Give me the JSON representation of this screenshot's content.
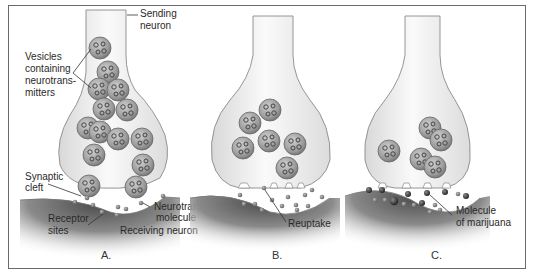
{
  "labels": {
    "sending_neuron": [
      "Sending",
      "neuron"
    ],
    "vesicles": [
      "Vesicles",
      "containing",
      "neurotrans-",
      "mitters"
    ],
    "synaptic_cleft": [
      "Synaptic",
      "cleft"
    ],
    "receptor_sites": [
      "Receptor",
      "sites"
    ],
    "neurotransmitter_molecule": [
      "Neurotransmitter",
      "molecule"
    ],
    "receiving_neuron": "Receiving neuron",
    "reuptake": "Reuptake",
    "marijuana_molecule": [
      "Molecule",
      "of marijuana"
    ]
  },
  "panels": [
    {
      "id": "A",
      "label": "A."
    },
    {
      "id": "B",
      "label": "B."
    },
    {
      "id": "C",
      "label": "C."
    }
  ],
  "colors": {
    "frame": "#6a6a6a",
    "neuron_fill": "#f1f1f1",
    "neuron_stroke": "#8a8a8a",
    "vesicle": "#9a9a9a",
    "receiving_shadow": "#5a5a5a",
    "molecule": "#7a7a7a",
    "marijuana": "#3a3a3a"
  }
}
